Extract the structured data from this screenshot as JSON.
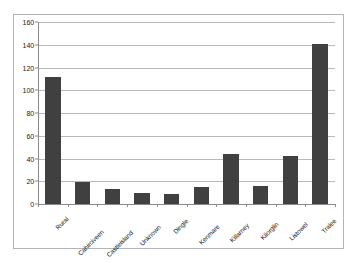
{
  "chart_data": {
    "type": "bar",
    "title": "",
    "xlabel": "",
    "ylabel": "",
    "categories": [
      "Rural",
      "Cahirciveen",
      "Castleisland",
      "Unknown",
      "Dingle",
      "Kenmare",
      "Killarney",
      "Kilorglin",
      "Listowel",
      "Tralee"
    ],
    "values": [
      112,
      19,
      13,
      10,
      9,
      15,
      44,
      16,
      42,
      141
    ],
    "ylim": [
      0,
      160
    ],
    "yticks": [
      0,
      20,
      40,
      60,
      80,
      100,
      120,
      140,
      160
    ],
    "ytick_labels": [
      "0",
      "20",
      "40",
      "60",
      "80",
      "100",
      "120",
      "140",
      "160"
    ],
    "grid": true,
    "legend": false,
    "legend_position": "none",
    "bar_color": "#404040",
    "gridline_color": "#b9b9b9",
    "axis_color": "#8a8a8a",
    "frame_color": "#b4b4b4",
    "background_color": "#ffffff"
  }
}
